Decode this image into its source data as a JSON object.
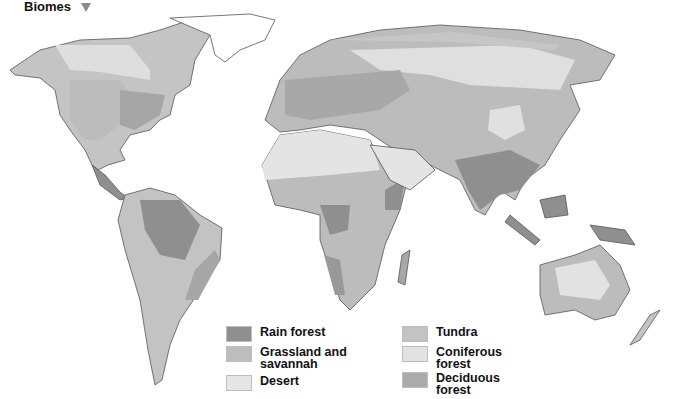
{
  "header": {
    "title": "Biomes",
    "indicator_icon": "triangle-down-icon"
  },
  "map": {
    "type": "world biome map",
    "colors": {
      "rain_forest": "#8f8f8f",
      "grassland": "#bdbdbd",
      "desert": "#e4e4e4",
      "tundra": "#c6c6c6",
      "coniferous": "#dedede",
      "deciduous": "#a8a8a8",
      "outline": "#555555"
    }
  },
  "legend": {
    "items": [
      {
        "label": "Rain forest",
        "color": "#8f8f8f"
      },
      {
        "label": "Grassland and savannah",
        "line1": "Grassland and",
        "line2": "savannah",
        "color": "#bdbdbd"
      },
      {
        "label": "Desert",
        "color": "#e6e6e6"
      },
      {
        "label": "Tundra",
        "color": "#c3c3c3"
      },
      {
        "label": "Coniferous forest",
        "line1": "Coniferous",
        "line2": "forest",
        "color": "#e2e2e2"
      },
      {
        "label": "Deciduous forest",
        "line1": "Deciduous",
        "line2": "forest",
        "color": "#ababab"
      }
    ]
  }
}
